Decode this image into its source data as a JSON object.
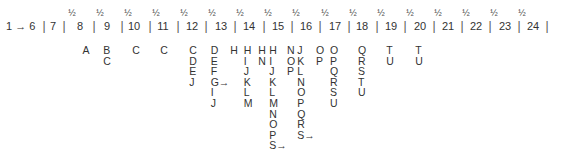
{
  "timeline": {
    "start_label": "1 → 6",
    "half_mark": "½",
    "numbers": [
      {
        "label": "7",
        "x": 53
      },
      {
        "label": "8",
        "x": 80
      },
      {
        "label": "9",
        "x": 107
      },
      {
        "label": "10",
        "x": 134
      },
      {
        "label": "11",
        "x": 163
      },
      {
        "label": "12",
        "x": 192
      },
      {
        "label": "13",
        "x": 221
      },
      {
        "label": "14",
        "x": 249
      },
      {
        "label": "15",
        "x": 278
      },
      {
        "label": "16",
        "x": 306
      },
      {
        "label": "17",
        "x": 335
      },
      {
        "label": "18",
        "x": 362
      },
      {
        "label": "19",
        "x": 391
      },
      {
        "label": "20",
        "x": 420
      },
      {
        "label": "21",
        "x": 448
      },
      {
        "label": "22",
        "x": 476
      },
      {
        "label": "23",
        "x": 505
      },
      {
        "label": "24",
        "x": 533
      }
    ],
    "separators_x": [
      44,
      64,
      94,
      122,
      150,
      178,
      206,
      235,
      264,
      292,
      320,
      349,
      377,
      405,
      434,
      462,
      490,
      519,
      547
    ],
    "half_marks_x": [
      72,
      100,
      128,
      156,
      184,
      212,
      240,
      268,
      296,
      325,
      353,
      381,
      410,
      438,
      466,
      494,
      522
    ]
  },
  "columns": [
    {
      "x": 86,
      "items": [
        "A"
      ]
    },
    {
      "x": 107,
      "items": [
        "B",
        "C"
      ]
    },
    {
      "x": 136,
      "items": [
        "C"
      ]
    },
    {
      "x": 164,
      "items": [
        "C"
      ]
    },
    {
      "x": 193,
      "items": [
        "C",
        "D",
        "E",
        "J"
      ]
    },
    {
      "x": 220,
      "items": [
        "D",
        "E",
        "F",
        "G→",
        "I",
        "J"
      ]
    },
    {
      "x": 234,
      "items": [
        "H"
      ]
    },
    {
      "x": 248,
      "items": [
        "H",
        "I",
        "J",
        "K",
        "L",
        "M"
      ]
    },
    {
      "x": 262,
      "items": [
        "H",
        "N"
      ]
    },
    {
      "x": 278,
      "items": [
        "H",
        "I",
        "J",
        "K",
        "L",
        "M",
        "N",
        "O",
        "P",
        "S→"
      ]
    },
    {
      "x": 291,
      "items": [
        "N",
        "O",
        "P"
      ]
    },
    {
      "x": 306,
      "items": [
        "J",
        "K",
        "L",
        "N",
        "O",
        "P",
        "Q",
        "R",
        "S→"
      ]
    },
    {
      "x": 320,
      "items": [
        "O",
        "P"
      ]
    },
    {
      "x": 334,
      "items": [
        "O",
        "P",
        "Q",
        "R",
        "S",
        "U"
      ]
    },
    {
      "x": 362,
      "items": [
        "Q",
        "R",
        "S",
        "T",
        "U"
      ]
    },
    {
      "x": 390,
      "items": [
        "T",
        "U"
      ]
    },
    {
      "x": 419,
      "items": [
        "T",
        "U"
      ]
    }
  ]
}
